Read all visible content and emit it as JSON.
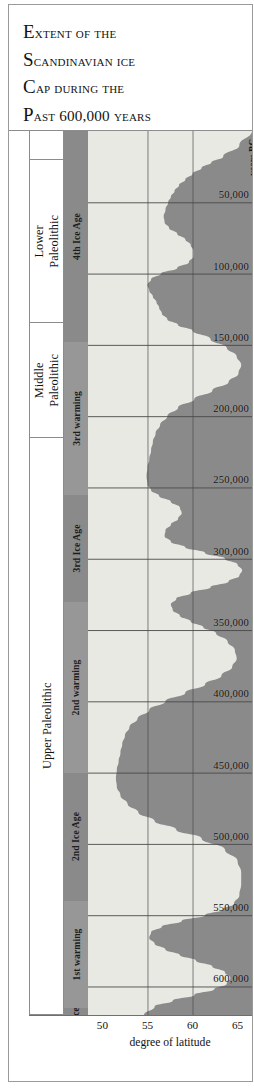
{
  "title": {
    "lines": [
      {
        "cap": "E",
        "rest": "xtent of the"
      },
      {
        "cap": "S",
        "rest": "candinavian ice"
      },
      {
        "cap": "C",
        "rest": "ap during the"
      },
      {
        "cap": "P",
        "rest": "ast 600,000 years"
      }
    ]
  },
  "axis": {
    "x_title": "degree of latitude",
    "x_ticks": [
      "50",
      "55",
      "60",
      "65"
    ],
    "y_unit_label": "years BC",
    "y_ticks": [
      "50,000",
      "100,000",
      "150,000",
      "200,000",
      "250,000",
      "300,000",
      "350,000",
      "400,000",
      "450,000",
      "500,000",
      "550,000",
      "600,000"
    ]
  },
  "epochs": [
    {
      "label": "",
      "from": 0,
      "to": 20000
    },
    {
      "label": "Lower\nPaleolithic",
      "from": 20000,
      "to": 135000
    },
    {
      "label": "Middle\nPaleolithic",
      "from": 135000,
      "to": 215000
    },
    {
      "label": "Upper Paleolithic",
      "from": 215000,
      "to": 620000
    }
  ],
  "phases": [
    {
      "label": "4th Ice Age",
      "from": 0,
      "to": 148000,
      "tone": "dark"
    },
    {
      "label": "3rd warming",
      "from": 148000,
      "to": 255000,
      "tone": "light"
    },
    {
      "label": "3rd Ice Age",
      "from": 255000,
      "to": 330000,
      "tone": "dark"
    },
    {
      "label": "2nd warming",
      "from": 330000,
      "to": 450000,
      "tone": "light"
    },
    {
      "label": "2nd Ice Age",
      "from": 450000,
      "to": 540000,
      "tone": "dark"
    },
    {
      "label": "1st warming",
      "from": 540000,
      "to": 615000,
      "tone": "light"
    },
    {
      "label": "1st Ice Age",
      "from": 615000,
      "to": 700000,
      "tone": "dark"
    }
  ],
  "colors": {
    "ice": "#8a8a8a",
    "ice_free": "#e9e9e4",
    "gridline": "#4a4a4a",
    "frame": "#8c8c8c",
    "phase_band_dark": "#8a8a8a",
    "phase_band_light": "#979797",
    "text": "#131313"
  },
  "chart_data": {
    "type": "area",
    "title": "Extent of the Scandinavian ice cap during the past 600,000 years",
    "xlabel": "degree of latitude",
    "ylabel": "years BC",
    "xlim": [
      48.4,
      66.6
    ],
    "ylim": [
      0,
      620000
    ],
    "y_inverted": true,
    "grid": true,
    "legend": "none",
    "series_name": "southern margin of ice cap (degrees latitude)",
    "note": "Shaded (dark grey) area to the right of the curve is ice-covered; light area to the left is ice-free. Values are the latitude of the ice margin at each age.",
    "x": [
      0,
      10000,
      18000,
      22000,
      26000,
      30000,
      34000,
      38000,
      42000,
      46000,
      50000,
      55000,
      60000,
      64000,
      68000,
      72000,
      76000,
      80000,
      84000,
      88000,
      92000,
      96000,
      100000,
      104000,
      108000,
      112000,
      116000,
      120000,
      124000,
      128000,
      132000,
      136000,
      140000,
      146000,
      152000,
      158000,
      164000,
      170000,
      176000,
      182000,
      188000,
      194000,
      200000,
      206000,
      212000,
      218000,
      224000,
      230000,
      236000,
      242000,
      248000,
      252000,
      256000,
      260000,
      264000,
      268000,
      272000,
      276000,
      280000,
      284000,
      288000,
      292000,
      296000,
      300000,
      304000,
      308000,
      312000,
      316000,
      320000,
      324000,
      328000,
      332000,
      336000,
      340000,
      344000,
      348000,
      352000,
      358000,
      364000,
      370000,
      376000,
      382000,
      388000,
      394000,
      400000,
      406000,
      412000,
      418000,
      424000,
      430000,
      436000,
      442000,
      448000,
      454000,
      460000,
      466000,
      472000,
      478000,
      484000,
      490000,
      496000,
      504000,
      512000,
      520000,
      528000,
      536000,
      542000,
      546000,
      550000,
      554000,
      558000,
      562000,
      566000,
      570000,
      574000,
      578000,
      582000,
      586000,
      590000,
      594000,
      598000,
      602000,
      606000,
      610000,
      614000,
      620000
    ],
    "y_latitude_of_ice_margin": [
      66.6,
      65.2,
      63.4,
      62.1,
      61.0,
      60.0,
      59.2,
      58.5,
      58.0,
      57.6,
      57.3,
      57.0,
      56.8,
      56.9,
      57.4,
      58.3,
      59.2,
      59.8,
      60.1,
      60.1,
      59.6,
      58.3,
      56.5,
      55.4,
      55.0,
      55.2,
      55.6,
      56.0,
      56.3,
      56.6,
      57.2,
      58.4,
      60.0,
      62.0,
      63.8,
      64.9,
      65.4,
      65.1,
      64.0,
      62.2,
      60.2,
      58.4,
      57.2,
      56.4,
      55.9,
      55.6,
      55.4,
      55.2,
      55.0,
      54.9,
      55.0,
      55.4,
      56.3,
      57.6,
      58.6,
      58.8,
      58.4,
      57.6,
      57.0,
      56.9,
      57.6,
      59.2,
      61.4,
      63.6,
      65.0,
      65.5,
      65.2,
      64.0,
      62.0,
      59.8,
      58.2,
      57.6,
      57.8,
      58.6,
      59.8,
      61.2,
      62.6,
      63.9,
      64.7,
      64.9,
      64.4,
      63.2,
      61.4,
      59.2,
      57.0,
      55.2,
      53.9,
      53.0,
      52.5,
      52.2,
      52.0,
      51.8,
      51.6,
      51.5,
      51.6,
      52.0,
      52.8,
      54.0,
      55.8,
      58.2,
      61.0,
      63.6,
      65.0,
      65.4,
      65.4,
      65.2,
      64.6,
      63.4,
      61.4,
      58.8,
      56.6,
      55.4,
      55.2,
      55.8,
      57.0,
      58.6,
      60.4,
      62.2,
      63.6,
      64.2,
      63.8,
      62.4,
      60.2,
      57.8,
      55.8,
      54.6
    ]
  }
}
